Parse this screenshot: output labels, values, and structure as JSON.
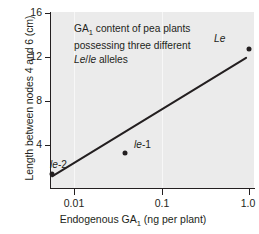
{
  "chart_data": {
    "type": "scatter",
    "title": "",
    "annotation_lines": [
      "GA<sub>1</sub> content of pea plants",
      "possessing three different",
      "<span class=\"it\">Le</span>/<span class=\"it\">le</span> alleles"
    ],
    "annotation_text": "GA1 content of pea plants possessing three different Le/le alleles",
    "xlabel": "Endogenous GA1 (ng per plant)",
    "xlabel_html": "Endogenous GA<sub>1</sub> (ng per plant)",
    "ylabel": "Length between nodes 4 and 6 (cm)",
    "xscale": "log",
    "xlim": [
      0.0071,
      1.12
    ],
    "ylim": [
      1.15,
      16.9
    ],
    "xticks": [
      "0.01",
      "0.1",
      "1.0"
    ],
    "xtick_values": [
      0.01,
      0.1,
      1.0
    ],
    "yticks": [
      "4",
      "8",
      "12",
      "16"
    ],
    "ytick_values": [
      4,
      8,
      12,
      16
    ],
    "grid": false,
    "points": [
      {
        "label": "le-2",
        "label_html": "<i>le</i><span class=\"rm\">-2</span>",
        "x": 0.0072,
        "y": 2.4
      },
      {
        "label": "le-1",
        "label_html": "<i>le</i><span class=\"rm\">-1</span>",
        "x": 0.045,
        "y": 4.3
      },
      {
        "label": "Le",
        "label_html": "<i>Le</i>",
        "x": 0.98,
        "y": 13.6
      }
    ],
    "trendline": {
      "x": [
        0.0073,
        0.92
      ],
      "y": [
        2.2,
        12.8
      ]
    },
    "series": [
      {
        "name": "GA1 vs internode length",
        "x": [
          0.0072,
          0.045,
          0.98
        ],
        "values": [
          2.4,
          4.3,
          13.6
        ]
      }
    ],
    "colors": {
      "plot_background": "#ebebeb",
      "page_background": "#ffffff",
      "ink": "#231f20",
      "line": "#231f20"
    }
  }
}
